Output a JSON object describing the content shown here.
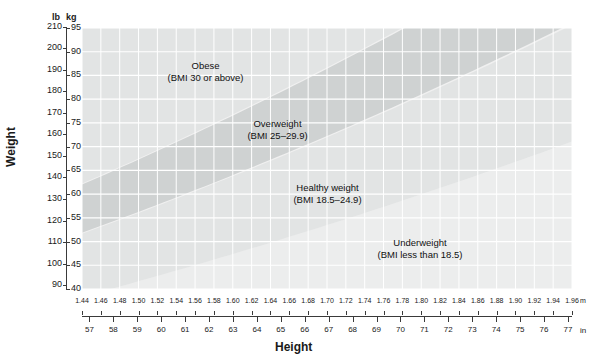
{
  "chart_data": {
    "type": "area",
    "title": "",
    "xlabel": "Height",
    "ylabel": "Weight",
    "grid": true,
    "legend": "none",
    "x_axes": [
      {
        "name": "metric-height",
        "unit": "m",
        "ticks": [
          1.44,
          1.46,
          1.48,
          1.5,
          1.52,
          1.54,
          1.56,
          1.58,
          1.6,
          1.62,
          1.64,
          1.66,
          1.68,
          1.7,
          1.72,
          1.74,
          1.76,
          1.78,
          1.8,
          1.82,
          1.84,
          1.86,
          1.88,
          1.9,
          1.92,
          1.94,
          1.96
        ],
        "tick_labels": [
          "1.44",
          "1.46",
          "1.48",
          "1.50",
          "1.52",
          "1.54",
          "1.56",
          "1.58",
          "1.60",
          "1.62",
          "1.64",
          "1.66",
          "1.68",
          "1.70",
          "1.72",
          "1.74",
          "1.76",
          "1.78",
          "1.80",
          "1.82",
          "1.84",
          "1.86",
          "1.88",
          "1.90",
          "1.92",
          "1.94",
          "1.96"
        ],
        "range": [
          1.44,
          1.96
        ]
      },
      {
        "name": "imperial-height",
        "unit": "in",
        "ticks": [
          57,
          58,
          59,
          60,
          61,
          62,
          63,
          64,
          65,
          66,
          67,
          68,
          69,
          70,
          71,
          72,
          73,
          74,
          75,
          76,
          77
        ],
        "tick_labels": [
          "57",
          "58",
          "59",
          "60",
          "61",
          "62",
          "63",
          "64",
          "65",
          "66",
          "67",
          "68",
          "69",
          "70",
          "71",
          "72",
          "73",
          "74",
          "75",
          "76",
          "77"
        ],
        "range": [
          56.69,
          77.17
        ]
      }
    ],
    "y_axes": [
      {
        "name": "imperial-weight",
        "unit": "lb",
        "ticks": [
          90,
          100,
          110,
          120,
          130,
          140,
          150,
          160,
          170,
          180,
          190,
          200,
          210
        ],
        "tick_labels": [
          "90",
          "100",
          "110",
          "120",
          "130",
          "140",
          "150",
          "160",
          "170",
          "180",
          "190",
          "200",
          "210"
        ],
        "range": [
          88.18,
          209.44
        ]
      },
      {
        "name": "metric-weight",
        "unit": "kg",
        "ticks": [
          40,
          45,
          50,
          55,
          60,
          65,
          70,
          75,
          80,
          85,
          90,
          95
        ],
        "tick_labels": [
          "40",
          "45",
          "50",
          "55",
          "60",
          "65",
          "70",
          "75",
          "80",
          "85",
          "90",
          "95"
        ],
        "range": [
          40,
          95
        ]
      }
    ],
    "bands": [
      {
        "name": "underweight",
        "label": "Underweight",
        "sublabel": "(BMI less than 18.5)",
        "bmi_min": null,
        "bmi_max": 18.5,
        "color": "#eceded"
      },
      {
        "name": "healthy-weight",
        "label": "Healthy weight",
        "sublabel": "(BMI 18.5–24.9)",
        "bmi_min": 18.5,
        "bmi_max": 24.9,
        "color": "#e2e4e4"
      },
      {
        "name": "overweight",
        "label": "Overweight",
        "sublabel": "(BMI 25–29.9)",
        "bmi_min": 25,
        "bmi_max": 29.9,
        "color": "#cfd2d2"
      },
      {
        "name": "obese",
        "label": "Obese",
        "sublabel": "(BMI 30 or above)",
        "bmi_min": 30,
        "bmi_max": null,
        "color": "#e2e4e4"
      }
    ]
  },
  "axes": {
    "weight_title": "Weight",
    "height_title": "Height",
    "lb_header": "lb",
    "kg_header": "kg",
    "m_unit": "m",
    "in_unit": "in"
  },
  "annotations": {
    "obese": {
      "line1": "Obese",
      "line2": "(BMI 30 or above)"
    },
    "overweight": {
      "line1": "Overweight",
      "line2": "(BMI 25–29.9)"
    },
    "healthy": {
      "line1": "Healthy weight",
      "line2": "(BMI 18.5–24.9)"
    },
    "underweight": {
      "line1": "Underweight",
      "line2": "(BMI less than 18.5)"
    }
  },
  "colors": {
    "plot_background": "#f0f0f0",
    "grid_line": "#ffffff",
    "axis_line": "#3a3a3a",
    "text": "#1a1a1a",
    "band_light": "#eceded",
    "band_mid": "#e2e4e4",
    "band_dark": "#cfd2d2"
  }
}
